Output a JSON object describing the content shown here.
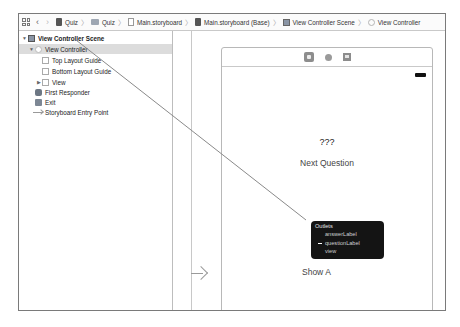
{
  "jumpbar": {
    "grid_icon": "related-items-grid-icon",
    "back_icon": "chevron-left-icon",
    "forward_icon": "chevron-right-icon",
    "crumbs": [
      {
        "label": "Quiz",
        "icon": "project-file-icon"
      },
      {
        "label": "Quiz",
        "icon": "folder-icon"
      },
      {
        "label": "Main.storyboard",
        "icon": "storyboard-file-icon"
      },
      {
        "label": "Main.storyboard (Base)",
        "icon": "storyboard-base-icon"
      },
      {
        "label": "View Controller Scene",
        "icon": "scene-icon"
      },
      {
        "label": "View Controller",
        "icon": "view-controller-icon"
      }
    ],
    "separator": "〉"
  },
  "outline": {
    "items": [
      {
        "label": "View Controller Scene",
        "level": 0,
        "disclosure": "▼",
        "icon": "scene-icon",
        "bold": true
      },
      {
        "label": "View Controller",
        "level": 1,
        "disclosure": "▼",
        "icon": "view-controller-icon",
        "selected": true
      },
      {
        "label": "Top Layout Guide",
        "level": 2,
        "icon": "layout-guide-icon"
      },
      {
        "label": "Bottom Layout Guide",
        "level": 2,
        "icon": "layout-guide-icon"
      },
      {
        "label": "View",
        "level": 2,
        "disclosure": "▶",
        "icon": "view-icon"
      },
      {
        "label": "First Responder",
        "level": 1,
        "icon": "first-responder-icon"
      },
      {
        "label": "Exit",
        "level": 1,
        "icon": "exit-icon"
      },
      {
        "label": "Storyboard Entry Point",
        "level": 1,
        "icon": "entry-point-arrow-icon"
      }
    ]
  },
  "canvas": {
    "scene_dock": [
      "view-controller-icon",
      "first-responder-icon",
      "exit-icon"
    ],
    "question_label": "???",
    "next_button": "Next Question",
    "answer_label": "???",
    "show_button": "Show A",
    "outlets_hud": {
      "title": "Outlets",
      "items": [
        {
          "label": "answerLabel",
          "connected": false
        },
        {
          "label": "questionLabel",
          "connected": true
        },
        {
          "label": "view",
          "connected": false
        }
      ]
    }
  },
  "colors": {
    "hud_background": "#141414",
    "selection": "#dcdcdc",
    "connection_line": "#8a8a8a"
  }
}
